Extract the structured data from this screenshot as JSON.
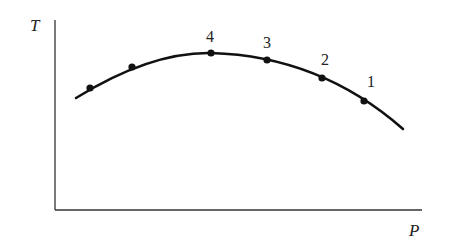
{
  "diagram": {
    "axes": {
      "y_label": "T",
      "x_label": "P",
      "color": "#333333"
    },
    "curve": {
      "color": "#111111",
      "description": "concave-down arc of T versus P"
    },
    "points": [
      {
        "label": "",
        "x": 90,
        "y": 88
      },
      {
        "label": "",
        "x": 132,
        "y": 67
      },
      {
        "label": "4",
        "x": 211,
        "y": 53
      },
      {
        "label": "3",
        "x": 267,
        "y": 60
      },
      {
        "label": "2",
        "x": 322,
        "y": 78
      },
      {
        "label": "1",
        "x": 364,
        "y": 101
      }
    ]
  }
}
